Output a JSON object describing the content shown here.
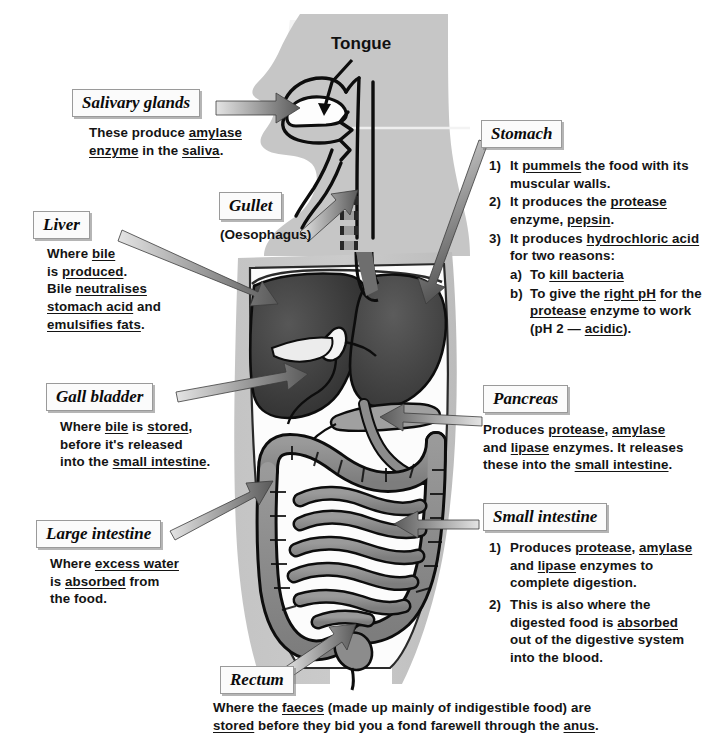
{
  "diagram": {
    "title": "The Digestive System",
    "colors": {
      "body_silhouette": "#bdbdbd",
      "body_silhouette_light": "#cfcfcf",
      "liver": "#3d3d3d",
      "stomach": "#4a4a4a",
      "intestine": "#8c8c8c",
      "pancreas": "#9a9a9a",
      "gall_bladder": "#f4f4f4",
      "outline": "#111111",
      "arrow_dark": "#4a4a4a",
      "arrow_light": "#d2d2d2",
      "label_bg": "#fbfbfb",
      "label_border": "#9a9a9a"
    }
  },
  "labels": {
    "tongue": "Tongue",
    "salivary_glands": "Salivary glands",
    "gullet": "Gullet",
    "gullet_sub": "(Oesophagus)",
    "liver": "Liver",
    "gall_bladder": "Gall bladder",
    "large_intestine": "Large intestine",
    "rectum": "Rectum",
    "stomach": "Stomach",
    "pancreas": "Pancreas",
    "small_intestine": "Small intestine"
  },
  "text": {
    "salivary_glands": {
      "line1_a": "These produce ",
      "line1_u": "amylase",
      "line2_u1": "enzyme",
      "line2_a": " in the ",
      "line2_u2": "saliva",
      "line2_b": "."
    },
    "liver": {
      "l1_a": "Where ",
      "l1_u": "bile",
      "l2_a": "is ",
      "l2_u": "produced",
      "l2_b": ".",
      "l3_a": "Bile ",
      "l3_u": "neutralises",
      "l4_u": "stomach acid",
      "l4_a": " and",
      "l5_u": "emulsifies fats",
      "l5_a": "."
    },
    "gall_bladder": {
      "l1_a": "Where ",
      "l1_u1": "bile",
      "l1_b": " is ",
      "l1_u2": "stored",
      "l1_c": ",",
      "l2": "before it's released",
      "l3_a": "into the ",
      "l3_u": "small intestine",
      "l3_b": "."
    },
    "large_intestine": {
      "l1_a": "Where ",
      "l1_u": "excess water",
      "l2_a": "is ",
      "l2_u": "absorbed",
      "l2_b": " from",
      "l3": "the food."
    },
    "stomach": {
      "items": [
        {
          "num": "1)",
          "l1_a": "It ",
          "l1_u": "pummels",
          "l1_b": " the food with its",
          "l2": "muscular walls."
        },
        {
          "num": "2)",
          "l1_a": "It produces the ",
          "l1_u": "protease",
          "l2_a": "enzyme, ",
          "l2_u": "pepsin",
          "l2_b": "."
        },
        {
          "num": "3)",
          "l1_a": "It produces ",
          "l1_u": "hydrochloric acid",
          "l2": "for two reasons:"
        }
      ],
      "sub": [
        {
          "num": "a)",
          "l1_a": "To ",
          "l1_u": "kill bacteria"
        },
        {
          "num": "b)",
          "l1_a": "To give the ",
          "l1_u": "right pH",
          "l1_b": " for the",
          "l2_u": "protease",
          "l2_a": " enzyme to work",
          "l3_a": "(pH 2 — ",
          "l3_u": "acidic",
          "l3_b": ")."
        }
      ]
    },
    "pancreas": {
      "l1_a": "Produces ",
      "l1_u1": "protease",
      "l1_b": ", ",
      "l1_u2": "amylase",
      "l2_a": "and ",
      "l2_u": "lipase",
      "l2_b": " enzymes.  It releases",
      "l3_a": "these into the ",
      "l3_u": "small intestine",
      "l3_b": "."
    },
    "small_intestine": {
      "items": [
        {
          "num": "1)",
          "l1_a": "Produces ",
          "l1_u1": "protease",
          "l1_b": ", ",
          "l1_u2": "amylase",
          "l2_a": "and ",
          "l2_u": "lipase",
          "l2_b": " enzymes to",
          "l3": "complete digestion."
        },
        {
          "num": "2)",
          "l1": "This is also where the",
          "l2_a": "digested food is ",
          "l2_u": "absorbed",
          "l3": "out of the digestive system",
          "l4": "into the blood."
        }
      ]
    },
    "rectum": {
      "l1_a": "Where the ",
      "l1_u": "faeces",
      "l1_b": " (made up mainly of indigestible food) are",
      "l2_u1": "stored",
      "l2_a": " before they bid you a fond farewell through the ",
      "l2_u2": "anus",
      "l2_b": "."
    }
  }
}
